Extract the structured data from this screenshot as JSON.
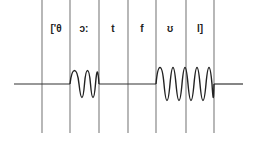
{
  "diagram": {
    "title": "",
    "segments": [
      {
        "label": "['θ",
        "voiced": false
      },
      {
        "label": "ɔ:",
        "voiced": true
      },
      {
        "label": "t",
        "voiced": false
      },
      {
        "label": "f",
        "voiced": false
      },
      {
        "label": "ʊ",
        "voiced": true
      },
      {
        "label": "l]",
        "voiced": true
      }
    ],
    "boundaries_x": [
      42,
      70,
      99,
      128,
      156,
      186,
      214
    ],
    "line_color": "#888888",
    "wave_color": "#222222"
  }
}
